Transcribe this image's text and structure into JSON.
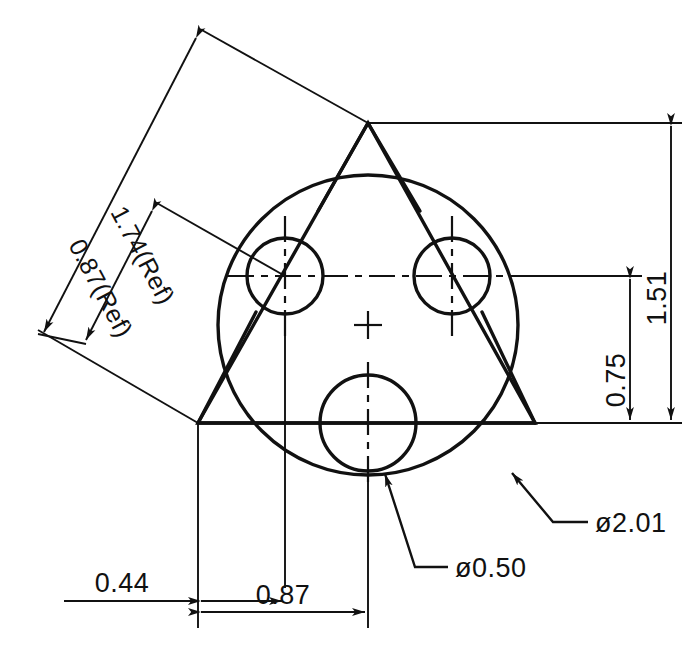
{
  "drawing": {
    "title": "Three-hole circular plate dimensioned drawing",
    "background_color": "#ffffff",
    "line_color": "#111111",
    "units_note": "inches (decimal)",
    "diameter_symbol": "ø"
  },
  "dimensions": {
    "ref_long": {
      "label": "1.74(Ref)",
      "value": 1.74,
      "reference": true,
      "orientation": "diagonal"
    },
    "ref_short": {
      "label": "0.87(Ref)",
      "value": 0.87,
      "reference": true,
      "orientation": "diagonal"
    },
    "vertical_outer": {
      "label": "1.51",
      "value": 1.51,
      "orientation": "vertical"
    },
    "vertical_inner": {
      "label": "0.75",
      "value": 0.75,
      "orientation": "vertical"
    },
    "horizontal_small": {
      "label": "0.44",
      "value": 0.44,
      "orientation": "horizontal"
    },
    "horizontal_large": {
      "label": "0.87",
      "value": 0.87,
      "orientation": "horizontal"
    },
    "hole_diameter": {
      "label": "ø0.50",
      "value": 0.5,
      "type": "diameter-callout"
    },
    "plate_diameter": {
      "label": "ø2.01",
      "value": 2.01,
      "type": "diameter-callout"
    }
  },
  "geometry": {
    "outer_circle": {
      "name": "plate-outer-circle",
      "cx": 368,
      "cy": 325,
      "r": 150
    },
    "holes": [
      {
        "name": "hole-upper-left",
        "cx": 285,
        "cy": 276,
        "r": 38
      },
      {
        "name": "hole-upper-right",
        "cx": 452,
        "cy": 276,
        "r": 38
      },
      {
        "name": "hole-bottom",
        "cx": 368,
        "cy": 423,
        "r": 48
      }
    ],
    "triangle_vertices": [
      {
        "name": "vertex-top",
        "x": 368,
        "y": 123
      },
      {
        "name": "vertex-lower-left",
        "x": 198,
        "y": 423
      },
      {
        "name": "vertex-lower-right",
        "x": 535,
        "y": 423
      }
    ],
    "center_mark": {
      "name": "plate-center-mark",
      "x": 368,
      "y": 325
    }
  }
}
